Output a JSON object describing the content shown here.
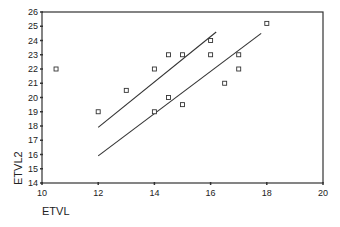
{
  "chart_data": {
    "type": "scatter",
    "title": "",
    "xlabel": "ETVL",
    "ylabel": "ETVL2",
    "xlim": [
      10,
      20
    ],
    "ylim": [
      14,
      26
    ],
    "xticks": [
      10,
      12,
      14,
      16,
      18,
      20
    ],
    "yticks": [
      14,
      15,
      16,
      17,
      18,
      19,
      20,
      21,
      22,
      23,
      24,
      25,
      26
    ],
    "grid": false,
    "legend": null,
    "marker": "open-square",
    "points": [
      {
        "x": 10.5,
        "y": 22
      },
      {
        "x": 12,
        "y": 19
      },
      {
        "x": 13,
        "y": 20.5
      },
      {
        "x": 14,
        "y": 22
      },
      {
        "x": 14,
        "y": 19
      },
      {
        "x": 14.5,
        "y": 23
      },
      {
        "x": 14.5,
        "y": 20
      },
      {
        "x": 15,
        "y": 23
      },
      {
        "x": 15,
        "y": 19.5
      },
      {
        "x": 16,
        "y": 24
      },
      {
        "x": 16,
        "y": 23
      },
      {
        "x": 16.5,
        "y": 21
      },
      {
        "x": 17,
        "y": 23
      },
      {
        "x": 17,
        "y": 22
      },
      {
        "x": 18,
        "y": 25.2
      }
    ],
    "lines": [
      {
        "name": "upper-line",
        "x1": 12,
        "y1": 17.9,
        "x2": 16.2,
        "y2": 24.6
      },
      {
        "name": "lower-line",
        "x1": 12,
        "y1": 15.9,
        "x2": 17.8,
        "y2": 24.5
      }
    ]
  },
  "colors": {
    "axis": "#333333",
    "marker": "#333333",
    "line": "#333333",
    "background": "#ffffff"
  }
}
